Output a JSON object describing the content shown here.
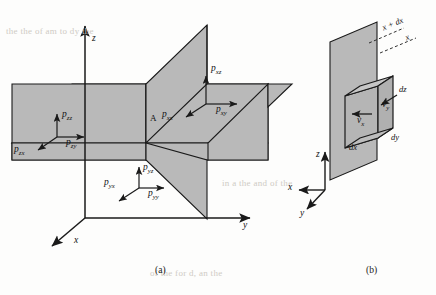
{
  "figure": {
    "background_color": "#fdfdfc",
    "plane_fill": "#b9b9b9",
    "plane_fill_light": "#c6c6c6",
    "line_color": "#1a1a1a",
    "caption_a": "(a)",
    "caption_b": "(b)"
  },
  "panel_a": {
    "point_label": "A",
    "axes": [
      {
        "name": "z",
        "label": "z"
      },
      {
        "name": "x",
        "label": "x"
      },
      {
        "name": "y",
        "label": "y"
      }
    ],
    "stress_groups": [
      {
        "group": "x-face",
        "labels": [
          {
            "sym": "p",
            "sub": "xz",
            "dir": "up"
          },
          {
            "sym": "p",
            "sub": "xy",
            "dir": "right"
          },
          {
            "sym": "p",
            "sub": "xx",
            "dir": "down-left"
          }
        ]
      },
      {
        "group": "z-face",
        "labels": [
          {
            "sym": "p",
            "sub": "zz",
            "dir": "up"
          },
          {
            "sym": "p",
            "sub": "zy",
            "dir": "right"
          },
          {
            "sym": "p",
            "sub": "zx",
            "dir": "down-left"
          }
        ]
      },
      {
        "group": "y-face",
        "labels": [
          {
            "sym": "p",
            "sub": "yz",
            "dir": "up"
          },
          {
            "sym": "p",
            "sub": "yy",
            "dir": "right"
          },
          {
            "sym": "p",
            "sub": "yx",
            "dir": "down-left"
          }
        ]
      }
    ]
  },
  "panel_b": {
    "plane_labels": [
      {
        "text": "x + dx"
      },
      {
        "text": "x"
      }
    ],
    "dimension_labels": [
      {
        "text": "dz"
      },
      {
        "text": "dy"
      },
      {
        "text": "dx"
      }
    ],
    "velocity_labels": [
      {
        "sym": "v",
        "sub": "x",
        "dir": "left"
      },
      {
        "sym": "v",
        "sub": "y",
        "dir": "down-left"
      }
    ],
    "axes": [
      {
        "name": "z",
        "label": "z"
      },
      {
        "name": "x",
        "label": "x"
      },
      {
        "name": "y",
        "label": "y"
      }
    ]
  },
  "bleed_text": {
    "rows": [
      "the the of am to dy the",
      "in a the and of the",
      "of the for d, an the"
    ]
  }
}
